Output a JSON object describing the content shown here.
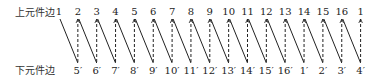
{
  "rows": {
    "top_label": "上元件边",
    "bottom_label": "下元件边"
  },
  "top_nodes": [
    "1",
    "2",
    "3",
    "4",
    "5",
    "6",
    "7",
    "8",
    "9",
    "10",
    "11",
    "12",
    "13",
    "14",
    "15",
    "16",
    "1"
  ],
  "bottom_nodes": [
    "5′",
    "6′",
    "7′",
    "8′",
    "9′",
    "10′",
    "11′",
    "12′",
    "13′",
    "14′",
    "15′",
    "16′",
    "1′",
    "2′",
    "3′",
    "4′"
  ],
  "connections": {
    "solid": "top[i] → bottom[i]",
    "dashed": "top[i+1] → bottom[i]"
  },
  "colors": {
    "line": "#222222",
    "text": "#222222"
  }
}
